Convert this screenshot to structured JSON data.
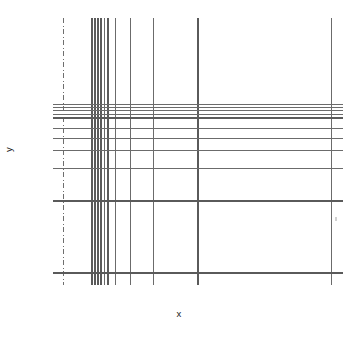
{
  "figure": {
    "title": "",
    "background_color": "#ffffff",
    "width": 358,
    "height": 337
  },
  "labels": {
    "xlabel": "x",
    "ylabel": "y"
  },
  "marks": {
    "stray_dot_name": "faint-stray-mark"
  },
  "chart_data": {
    "type": "line",
    "title": "",
    "xlabel": "x",
    "ylabel": "y",
    "grid": false,
    "legend": null,
    "xlim": [
      55,
      345
    ],
    "ylim": [
      285,
      12
    ],
    "axis_ticks": {
      "x_tick_labels": [],
      "y_tick_labels": []
    },
    "series": [
      {
        "name": "vertical-lines",
        "orientation": "vertical",
        "y_extent": [
          18,
          285
        ],
        "lines": [
          {
            "x": 63,
            "style": "dashdot",
            "color": "#6e6e6e",
            "width": 1.0
          },
          {
            "x": 92,
            "style": "solid",
            "color": "#5a5a5a",
            "width": 1.2
          },
          {
            "x": 95,
            "style": "solid",
            "color": "#5a5a5a",
            "width": 1.2
          },
          {
            "x": 98,
            "style": "solid",
            "color": "#5a5a5a",
            "width": 1.2
          },
          {
            "x": 101,
            "style": "solid",
            "color": "#5a5a5a",
            "width": 1.2
          },
          {
            "x": 104,
            "style": "solid",
            "color": "#6b6b6b",
            "width": 1.0
          },
          {
            "x": 108,
            "style": "solid",
            "color": "#5a5a5a",
            "width": 1.2
          },
          {
            "x": 115,
            "style": "solid",
            "color": "#6b6b6b",
            "width": 1.0
          },
          {
            "x": 130,
            "style": "solid",
            "color": "#6b6b6b",
            "width": 1.0
          },
          {
            "x": 153,
            "style": "solid",
            "color": "#6b6b6b",
            "width": 1.0
          },
          {
            "x": 198,
            "style": "solid",
            "color": "#5a5a5a",
            "width": 1.2
          },
          {
            "x": 331,
            "style": "solid",
            "color": "#6b6b6b",
            "width": 1.0
          }
        ]
      },
      {
        "name": "horizontal-lines",
        "orientation": "horizontal",
        "x_extent": [
          53,
          343
        ],
        "lines": [
          {
            "y": 104,
            "style": "solid",
            "color": "#6b6b6b",
            "width": 1.0
          },
          {
            "y": 107,
            "style": "solid",
            "color": "#6b6b6b",
            "width": 1.0
          },
          {
            "y": 110,
            "style": "solid",
            "color": "#6b6b6b",
            "width": 1.0
          },
          {
            "y": 114,
            "style": "solid",
            "color": "#6b6b6b",
            "width": 1.0
          },
          {
            "y": 118,
            "style": "solid",
            "color": "#5a5a5a",
            "width": 1.2
          },
          {
            "y": 128,
            "style": "solid",
            "color": "#6b6b6b",
            "width": 1.0
          },
          {
            "y": 138,
            "style": "solid",
            "color": "#6b6b6b",
            "width": 1.0
          },
          {
            "y": 150,
            "style": "solid",
            "color": "#6b6b6b",
            "width": 1.0
          },
          {
            "y": 168,
            "style": "solid",
            "color": "#6b6b6b",
            "width": 1.0
          },
          {
            "y": 201,
            "style": "solid",
            "color": "#5a5a5a",
            "width": 1.1
          },
          {
            "y": 273,
            "style": "solid",
            "color": "#5a5a5a",
            "width": 1.1
          }
        ]
      }
    ]
  }
}
